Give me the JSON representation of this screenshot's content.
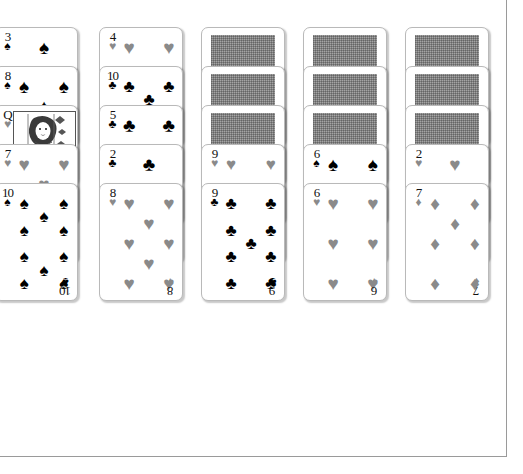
{
  "app": {
    "title": "Solitaire",
    "background_color": "#ffffff",
    "border_color": "#9a9a9a",
    "card_face_color": "#ffffff",
    "card_border_color": "#b9b9b9",
    "black_suit_color": "#000000",
    "red_suit_color": "#8a8a8a",
    "card_back_color": "#8e8e8e"
  },
  "glyphs": {
    "spade": "♠",
    "heart": "♥",
    "club": "♣",
    "diamond": "♦"
  },
  "tableau": {
    "column_count": 5,
    "columns": [
      {
        "name": "tableau-column-1",
        "x": -6,
        "face_down_count": 0,
        "cards": [
          {
            "rank": "3",
            "suit": "spade",
            "color": "black",
            "face_up": true,
            "offset": 0,
            "art": "pips"
          },
          {
            "rank": "8",
            "suit": "spade",
            "color": "black",
            "face_up": true,
            "offset": 39,
            "art": "pips"
          },
          {
            "rank": "Q",
            "suit": "heart",
            "color": "red",
            "face_up": true,
            "offset": 78,
            "art": "face"
          },
          {
            "rank": "7",
            "suit": "heart",
            "color": "red",
            "face_up": true,
            "offset": 117,
            "art": "pips"
          },
          {
            "rank": "10",
            "suit": "spade",
            "color": "black",
            "face_up": true,
            "offset": 156,
            "art": "pips",
            "final": true
          }
        ]
      },
      {
        "name": "tableau-column-2",
        "x": 99,
        "face_down_count": 0,
        "cards": [
          {
            "rank": "4",
            "suit": "heart",
            "color": "red",
            "face_up": true,
            "offset": 0,
            "art": "pips"
          },
          {
            "rank": "10",
            "suit": "club",
            "color": "black",
            "face_up": true,
            "offset": 39,
            "art": "pips"
          },
          {
            "rank": "5",
            "suit": "club",
            "color": "black",
            "face_up": true,
            "offset": 78,
            "art": "pips"
          },
          {
            "rank": "2",
            "suit": "club",
            "color": "black",
            "face_up": true,
            "offset": 117,
            "art": "pips"
          },
          {
            "rank": "8",
            "suit": "heart",
            "color": "red",
            "face_up": true,
            "offset": 156,
            "art": "pips",
            "final": true
          }
        ]
      },
      {
        "name": "tableau-column-3",
        "x": 201,
        "face_down_count": 3,
        "cards": [
          {
            "rank": "",
            "suit": "",
            "color": "",
            "face_up": false,
            "offset": 0,
            "art": "back"
          },
          {
            "rank": "",
            "suit": "",
            "color": "",
            "face_up": false,
            "offset": 39,
            "art": "back"
          },
          {
            "rank": "",
            "suit": "",
            "color": "",
            "face_up": false,
            "offset": 78,
            "art": "back"
          },
          {
            "rank": "9",
            "suit": "heart",
            "color": "red",
            "face_up": true,
            "offset": 117,
            "art": "pips"
          },
          {
            "rank": "9",
            "suit": "club",
            "color": "black",
            "face_up": true,
            "offset": 156,
            "art": "pips",
            "final": true
          }
        ]
      },
      {
        "name": "tableau-column-4",
        "x": 303,
        "face_down_count": 3,
        "cards": [
          {
            "rank": "",
            "suit": "",
            "color": "",
            "face_up": false,
            "offset": 0,
            "art": "back"
          },
          {
            "rank": "",
            "suit": "",
            "color": "",
            "face_up": false,
            "offset": 39,
            "art": "back"
          },
          {
            "rank": "",
            "suit": "",
            "color": "",
            "face_up": false,
            "offset": 78,
            "art": "back"
          },
          {
            "rank": "6",
            "suit": "spade",
            "color": "black",
            "face_up": true,
            "offset": 117,
            "art": "pips"
          },
          {
            "rank": "6",
            "suit": "heart",
            "color": "red",
            "face_up": true,
            "offset": 156,
            "art": "pips",
            "final": true
          }
        ]
      },
      {
        "name": "tableau-column-5",
        "x": 405,
        "face_down_count": 3,
        "cards": [
          {
            "rank": "",
            "suit": "",
            "color": "",
            "face_up": false,
            "offset": 0,
            "art": "back"
          },
          {
            "rank": "",
            "suit": "",
            "color": "",
            "face_up": false,
            "offset": 39,
            "art": "back"
          },
          {
            "rank": "",
            "suit": "",
            "color": "",
            "face_up": false,
            "offset": 78,
            "art": "back"
          },
          {
            "rank": "2",
            "suit": "heart",
            "color": "red",
            "face_up": true,
            "offset": 117,
            "art": "pips"
          },
          {
            "rank": "7",
            "suit": "diamond",
            "color": "red",
            "face_up": true,
            "offset": 156,
            "art": "pips",
            "final": true
          }
        ]
      }
    ]
  },
  "pip_layouts": {
    "2": [
      [
        50,
        14
      ],
      [
        50,
        86
      ]
    ],
    "3": [
      [
        50,
        14
      ],
      [
        50,
        50
      ],
      [
        50,
        86
      ]
    ],
    "4": [
      [
        18,
        14
      ],
      [
        82,
        14
      ],
      [
        18,
        86
      ],
      [
        82,
        86
      ]
    ],
    "5": [
      [
        18,
        14
      ],
      [
        82,
        14
      ],
      [
        50,
        50
      ],
      [
        18,
        86
      ],
      [
        82,
        86
      ]
    ],
    "6": [
      [
        18,
        14
      ],
      [
        82,
        14
      ],
      [
        18,
        50
      ],
      [
        82,
        50
      ],
      [
        18,
        86
      ],
      [
        82,
        86
      ]
    ],
    "7": [
      [
        18,
        14
      ],
      [
        82,
        14
      ],
      [
        50,
        32
      ],
      [
        18,
        50
      ],
      [
        82,
        50
      ],
      [
        18,
        86
      ],
      [
        82,
        86
      ]
    ],
    "8": [
      [
        18,
        14
      ],
      [
        82,
        14
      ],
      [
        50,
        32
      ],
      [
        18,
        50
      ],
      [
        82,
        50
      ],
      [
        50,
        68
      ],
      [
        18,
        86
      ],
      [
        82,
        86
      ]
    ],
    "9": [
      [
        18,
        14
      ],
      [
        82,
        14
      ],
      [
        18,
        38
      ],
      [
        82,
        38
      ],
      [
        50,
        50
      ],
      [
        18,
        62
      ],
      [
        82,
        62
      ],
      [
        18,
        86
      ],
      [
        82,
        86
      ]
    ],
    "10": [
      [
        18,
        14
      ],
      [
        82,
        14
      ],
      [
        50,
        26
      ],
      [
        18,
        38
      ],
      [
        82,
        38
      ],
      [
        18,
        62
      ],
      [
        82,
        62
      ],
      [
        50,
        74
      ],
      [
        18,
        86
      ],
      [
        82,
        86
      ]
    ],
    "Q": []
  }
}
